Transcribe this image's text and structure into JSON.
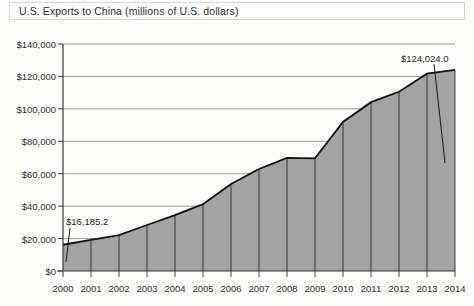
{
  "title": {
    "text": "U.S. Exports to China (millions of U.S. dollars)"
  },
  "chart_data": {
    "type": "area",
    "title": "U.S. Exports to China (millions of U.S. dollars)",
    "xlabel": "",
    "ylabel": "",
    "ylim": [
      0,
      140000
    ],
    "xlim": [
      2000,
      2014
    ],
    "grid": true,
    "legend": false,
    "categories": [
      "2000",
      "2001",
      "2002",
      "2003",
      "2004",
      "2005",
      "2006",
      "2007",
      "2008",
      "2009",
      "2010",
      "2011",
      "2012",
      "2013",
      "2014"
    ],
    "values": [
      16185.2,
      19182.3,
      22127.7,
      28367.9,
      34427.8,
      41192.0,
      53673.0,
      62936.9,
      69732.8,
      69496.7,
      91911.1,
      104121.5,
      110516.6,
      121721.0,
      124024.0
    ],
    "y_ticks": [
      "$0",
      "$20,000",
      "$40,000",
      "$60,000",
      "$80,000",
      "$100,000",
      "$120,000",
      "$140,000"
    ],
    "y_tick_values": [
      0,
      20000,
      40000,
      60000,
      80000,
      100000,
      120000,
      140000
    ],
    "annotations": [
      {
        "name": "first-point-label",
        "text": "$16,185.2",
        "year": "2000",
        "value": 16185.2
      },
      {
        "name": "last-point-label",
        "text": "$124,024.0",
        "year": "2014",
        "value": 124024.0
      }
    ],
    "colors": {
      "area_fill": "#a3a3a3",
      "area_line": "#111111",
      "gridline": "#8c8c8c",
      "axis": "#3a3a3a",
      "background": "#fcfcfb"
    }
  }
}
